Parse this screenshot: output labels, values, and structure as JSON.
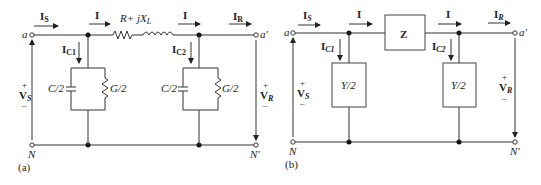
{
  "diagram_a": {
    "caption": "(a)",
    "series_impedance_label": "R+ jX",
    "series_impedance_sub": "L",
    "current_source": "I",
    "current_source_sub": "S",
    "current_line": "I",
    "current_line_2": "I",
    "current_receive": "I",
    "current_receive_sub": "R",
    "current_c1": "I",
    "current_c1_sub": "C1",
    "current_c2": "I",
    "current_c2_sub": "C2",
    "cap_label_1": "C/2",
    "cond_label_1": "G/2",
    "cap_label_2": "C/2",
    "cond_label_2": "G/2",
    "terminal_a": "a",
    "terminal_a_prime": "a'",
    "terminal_n": "N",
    "terminal_n_prime": "N'",
    "voltage_source": "V",
    "voltage_source_sub": "S",
    "voltage_receive": "V",
    "voltage_receive_sub": "R",
    "plus": "+",
    "minus": "–"
  },
  "diagram_b": {
    "caption": "(b)",
    "series_box_label": "Z",
    "shunt_box_label_1": "Y/2",
    "shunt_box_label_2": "Y/2",
    "current_source": "I",
    "current_source_sub": "S",
    "current_line": "I",
    "current_line_2": "I",
    "current_receive": "I",
    "current_receive_sub": "R",
    "current_c1": "I",
    "current_c1_sub": "C1",
    "current_c2": "I",
    "current_c2_sub": "C2",
    "terminal_a": "a",
    "terminal_a_prime": "a'",
    "terminal_n": "N",
    "terminal_n_prime": "N'",
    "voltage_source": "V",
    "voltage_source_sub": "S",
    "voltage_receive": "V",
    "voltage_receive_sub": "R",
    "plus": "+",
    "minus": "–"
  }
}
